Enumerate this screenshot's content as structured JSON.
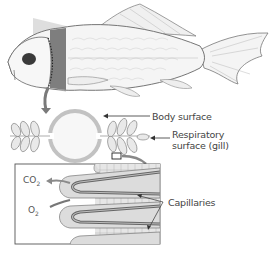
{
  "figure": {
    "type": "gas-exchange diagram (fish)",
    "colors": {
      "outline": "#555555",
      "shading_dark": "#7a7a7a",
      "shading_light": "#c8c8c8",
      "background": "#ffffff",
      "label_text": "#444444"
    }
  },
  "labels": {
    "body_surface": "Body surface",
    "respiratory_line1": "Respiratory",
    "respiratory_line2": "surface (gill)",
    "capillaries": "Capillaries",
    "co2_base": "CO",
    "co2_sub": "2",
    "o2_base": "O",
    "o2_sub": "2"
  }
}
